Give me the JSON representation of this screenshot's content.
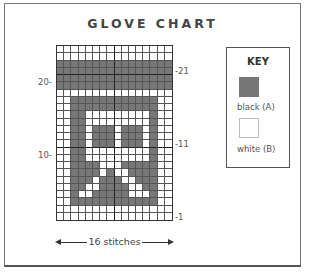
{
  "title": "GLOVE CHART",
  "chart": {
    "columns": 16,
    "rows": 24,
    "width_label": "16 stitches",
    "left_row_labels": [
      {
        "text": "20-",
        "row": 20
      },
      {
        "text": "10-",
        "row": 10
      }
    ],
    "right_row_labels": [
      {
        "text": "-21",
        "row": 21
      },
      {
        "text": "-11",
        "row": 11
      },
      {
        "text": "-1",
        "row": 1
      }
    ],
    "dark_color": "#777777",
    "light_color": "#ffffff",
    "pattern_top_to_bottom": [
      "0000000000000000",
      "0000000000000000",
      "1111111111111111",
      "1111111111111111",
      "1111111111111111",
      "1111111111111111",
      "0000000000000000",
      "0011111111111100",
      "0011111111111100",
      "0011000000000100",
      "0011000000000100",
      "0011011101110100",
      "0011011101110100",
      "0011011101110100",
      "0011000000000100",
      "0011000000000100",
      "0011110001111100",
      "0011110100111100",
      "0011101110011100",
      "0011001111001100",
      "0010011111000100",
      "0011111111111100",
      "0000000000000000",
      "0000000000000000"
    ]
  },
  "key": {
    "title": "KEY",
    "items": [
      {
        "label": "black (A)",
        "color": "#777777"
      },
      {
        "label": "white (B)",
        "color": "#ffffff"
      }
    ]
  }
}
